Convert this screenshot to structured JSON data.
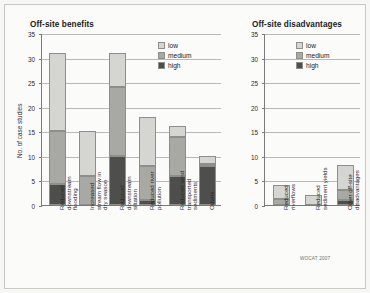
{
  "figure": {
    "credit": "WOCAT 2007",
    "ylabel": "No. of case studies",
    "colors": {
      "low": "#d5d5d2",
      "medium": "#a8a8a4",
      "high": "#4e4e4c",
      "grid": "#b9b9b5",
      "axis": "#7a7a78",
      "background": "#fbfbfa"
    }
  },
  "legend": {
    "entries": [
      {
        "key": "low",
        "label": "low"
      },
      {
        "key": "medium",
        "label": "medium"
      },
      {
        "key": "high",
        "label": "high"
      }
    ]
  },
  "chart_data": [
    {
      "type": "bar",
      "stacked": true,
      "title": "Off-site benefits",
      "xlabel": "",
      "ylabel": "No. of case studies",
      "ylim": [
        0,
        35
      ],
      "yticks": [
        0,
        5,
        10,
        15,
        20,
        25,
        30,
        35
      ],
      "grid": true,
      "legend_position": "top-right",
      "categories": [
        "Reduced downstream flooding",
        "Increased stream flow in dry season",
        "Reduced downstream siltation",
        "Reduced river pollution",
        "Reduced wind transported sediments",
        "Others"
      ],
      "category_lines": [
        [
          "Reduced",
          "downstream",
          "flooding"
        ],
        [
          "Increased",
          "stream flow in",
          "dry season"
        ],
        [
          "Reduced",
          "downstream",
          "siltation"
        ],
        [
          "Reduced river",
          "pollution"
        ],
        [
          "Reduced wind",
          "transported",
          "sediments"
        ],
        [
          "Others"
        ]
      ],
      "series": [
        {
          "name": "high",
          "values": [
            4.2,
            0,
            10,
            1,
            6,
            8
          ]
        },
        {
          "name": "medium",
          "values": [
            10.8,
            6,
            14,
            7,
            7.8,
            0.4
          ]
        },
        {
          "name": "low",
          "values": [
            16,
            9,
            7,
            10,
            2.2,
            1.6
          ]
        }
      ],
      "totals": [
        31,
        15,
        31,
        18,
        16,
        10
      ]
    },
    {
      "type": "bar",
      "stacked": true,
      "title": "Off-site disadvantages",
      "xlabel": "",
      "ylabel": "",
      "ylim": [
        0,
        35
      ],
      "yticks": [
        0,
        5,
        10,
        15,
        20,
        25,
        30,
        35
      ],
      "grid": true,
      "legend_position": "top-right",
      "categories": [
        "Reduced riverflows",
        "Reduced sediment yields",
        "Other off-site disadvantages"
      ],
      "category_lines": [
        [
          "Reduced",
          "riverflows"
        ],
        [
          "Reduced",
          "sediment yields"
        ],
        [
          "Other off-site",
          "disadvantages"
        ]
      ],
      "series": [
        {
          "name": "high",
          "values": [
            0,
            0,
            1
          ]
        },
        {
          "name": "medium",
          "values": [
            1.2,
            0,
            2
          ]
        },
        {
          "name": "low",
          "values": [
            2.8,
            2,
            5.2
          ]
        }
      ],
      "totals": [
        4,
        2,
        8.2
      ]
    }
  ]
}
